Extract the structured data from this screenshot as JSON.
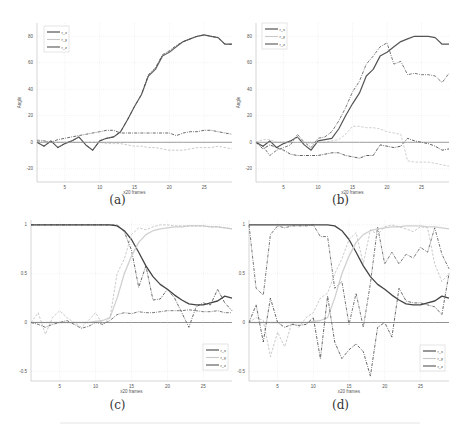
{
  "figure": {
    "captions": [
      "(a)",
      "(b)",
      "(c)",
      "(d)"
    ]
  },
  "chart_data": [
    {
      "id": "a",
      "type": "line",
      "caption": "(a)",
      "xlabel": "x20 frames",
      "ylabel": "Angle",
      "xlim": [
        1,
        29
      ],
      "ylim": [
        -30,
        90
      ],
      "xticks": [
        5,
        10,
        15,
        20,
        25
      ],
      "yticks": [
        -20,
        0,
        20,
        40,
        60,
        80
      ],
      "grid": true,
      "legend": {
        "position": "upper left",
        "entries": [
          "r_x",
          "r_y",
          "r_z"
        ]
      },
      "x": [
        1,
        2,
        3,
        4,
        5,
        6,
        7,
        8,
        9,
        10,
        11,
        12,
        13,
        14,
        15,
        16,
        17,
        18,
        19,
        20,
        21,
        22,
        23,
        24,
        25,
        26,
        27,
        28,
        29
      ],
      "series": [
        {
          "name": "ground truth",
          "style": "solid",
          "color": "#666666",
          "width": 1.2,
          "values": [
            0,
            -3,
            1,
            -4,
            -1,
            1,
            4,
            -2,
            -6,
            1,
            3,
            4,
            8,
            17,
            27,
            36,
            50,
            55,
            65,
            68,
            72,
            76,
            78,
            80,
            81,
            80,
            79,
            74,
            74
          ]
        },
        {
          "name": "r_x",
          "style": "dashdot",
          "color": "#444444",
          "width": 0.8,
          "values": [
            0,
            -3,
            1,
            -4,
            -1,
            1,
            4,
            -2,
            -6,
            1,
            3,
            4,
            8,
            17,
            27,
            36,
            51,
            56,
            66,
            69,
            73,
            76,
            78,
            80,
            81,
            80,
            79,
            74,
            74
          ]
        },
        {
          "name": "r_y",
          "style": "dashdot",
          "color": "#444444",
          "width": 0.8,
          "values": [
            1,
            1,
            0,
            2,
            3,
            4,
            5,
            6,
            7,
            8,
            9,
            9,
            7,
            7,
            7,
            7,
            7,
            7,
            7,
            7,
            5,
            7,
            8,
            8,
            9,
            9,
            8,
            7,
            6
          ]
        },
        {
          "name": "r_z",
          "style": "dashed",
          "color": "#bdbdbd",
          "width": 0.8,
          "values": [
            2,
            1,
            0,
            0,
            0,
            0,
            0,
            0,
            0,
            0,
            -1,
            -1,
            -1,
            -2,
            -3,
            -3,
            -4,
            -4,
            -5,
            -6,
            -6,
            -6,
            -5,
            -4,
            -4,
            -4,
            -3,
            -4,
            -5
          ]
        },
        {
          "name": "zero",
          "style": "solid",
          "color": "#888888",
          "width": 0.8,
          "values": [
            0,
            0,
            0,
            0,
            0,
            0,
            0,
            0,
            0,
            0,
            0,
            0,
            0,
            0,
            0,
            0,
            0,
            0,
            0,
            0,
            0,
            0,
            0,
            0,
            0,
            0,
            0,
            0,
            0
          ]
        }
      ]
    },
    {
      "id": "b",
      "type": "line",
      "caption": "(b)",
      "xlabel": "x20 frames",
      "ylabel": "Angle",
      "xlim": [
        1,
        29
      ],
      "ylim": [
        -30,
        90
      ],
      "xticks": [
        5,
        10,
        15,
        20,
        25
      ],
      "yticks": [
        -20,
        0,
        20,
        40,
        60,
        80
      ],
      "grid": true,
      "legend": {
        "position": "upper left",
        "entries": [
          "r_x",
          "r_y",
          "r_z"
        ]
      },
      "x": [
        1,
        2,
        3,
        4,
        5,
        6,
        7,
        8,
        9,
        10,
        11,
        12,
        13,
        14,
        15,
        16,
        17,
        18,
        19,
        20,
        21,
        22,
        23,
        24,
        25,
        26,
        27,
        28,
        29
      ],
      "series": [
        {
          "name": "ground truth",
          "style": "solid",
          "color": "#555555",
          "width": 1.2,
          "values": [
            0,
            -3,
            1,
            -4,
            -1,
            1,
            4,
            -2,
            -6,
            1,
            2,
            3,
            10,
            20,
            29,
            37,
            50,
            55,
            65,
            68,
            72,
            76,
            78,
            80,
            80,
            80,
            79,
            74,
            74
          ]
        },
        {
          "name": "r_x",
          "style": "dashdot",
          "color": "#555555",
          "width": 0.8,
          "values": [
            0,
            -3,
            -10,
            -6,
            -4,
            -2,
            6,
            0,
            -4,
            3,
            4,
            8,
            16,
            26,
            38,
            46,
            59,
            65,
            72,
            75,
            59,
            61,
            51,
            52,
            51,
            51,
            50,
            45,
            52
          ]
        },
        {
          "name": "r_y",
          "style": "dashdot",
          "color": "#333333",
          "width": 0.8,
          "values": [
            0,
            -5,
            -2,
            -4,
            -6,
            -9,
            -10,
            -10,
            -10,
            -10,
            -9,
            -8,
            -8,
            -10,
            -11,
            -12,
            -10,
            -10,
            -2,
            -3,
            -4,
            -3,
            3,
            1,
            0,
            -1,
            -3,
            -6,
            -5
          ]
        },
        {
          "name": "r_z",
          "style": "dashed",
          "color": "#c4c4c4",
          "width": 0.8,
          "values": [
            0,
            2,
            2,
            0,
            0,
            0,
            4,
            0,
            -1,
            0,
            0,
            1,
            2,
            6,
            12,
            12,
            11,
            11,
            10,
            8,
            7,
            6,
            -14,
            -15,
            -15,
            -15,
            -16,
            -17,
            -18
          ]
        },
        {
          "name": "zero",
          "style": "solid",
          "color": "#888888",
          "width": 0.8,
          "values": [
            0,
            0,
            0,
            0,
            0,
            0,
            0,
            0,
            0,
            0,
            0,
            0,
            0,
            0,
            0,
            0,
            0,
            0,
            0,
            0,
            0,
            0,
            0,
            0,
            0,
            0,
            0,
            0,
            0
          ]
        }
      ]
    },
    {
      "id": "c",
      "type": "line",
      "caption": "(c)",
      "xlabel": "x20 frames",
      "ylabel": "",
      "xlim": [
        1,
        29
      ],
      "ylim": [
        -0.6,
        1.05
      ],
      "xticks": [
        5,
        10,
        15,
        20,
        25
      ],
      "yticks": [
        -0.5,
        0,
        0.5,
        1
      ],
      "grid": true,
      "legend": {
        "position": "lower right",
        "entries": [
          "r_x",
          "r_y",
          "r_z"
        ]
      },
      "x": [
        1,
        2,
        3,
        4,
        5,
        6,
        7,
        8,
        9,
        10,
        11,
        12,
        13,
        14,
        15,
        16,
        17,
        18,
        19,
        20,
        21,
        22,
        23,
        24,
        25,
        26,
        27,
        28,
        29
      ],
      "series": [
        {
          "name": "q_w",
          "style": "solid",
          "color": "#444444",
          "width": 1.3,
          "values": [
            1,
            1,
            1,
            1,
            1,
            1,
            1,
            1,
            1,
            1,
            1,
            1,
            0.99,
            0.94,
            0.85,
            0.72,
            0.58,
            0.47,
            0.39,
            0.34,
            0.28,
            0.23,
            0.19,
            0.18,
            0.18,
            0.2,
            0.22,
            0.27,
            0.25
          ]
        },
        {
          "name": "r_x",
          "style": "dashdot",
          "color": "#444444",
          "width": 0.8,
          "values": [
            1,
            1,
            1,
            1,
            1,
            1,
            1,
            1,
            1,
            1,
            1,
            1,
            1,
            0.93,
            0.74,
            0.36,
            0.58,
            0.23,
            0.24,
            0.34,
            0.25,
            0.1,
            -0.05,
            0.16,
            0.2,
            0.18,
            0.34,
            0.2,
            0.12
          ]
        },
        {
          "name": "q_y",
          "style": "solid",
          "color": "#d0d0d0",
          "width": 1.3,
          "values": [
            0,
            0,
            0,
            0,
            0,
            0,
            0,
            0,
            0,
            0.01,
            0.02,
            0.05,
            0.25,
            0.5,
            0.68,
            0.82,
            0.9,
            0.94,
            0.96,
            0.97,
            0.98,
            0.98,
            0.99,
            0.99,
            0.99,
            0.98,
            0.98,
            0.97,
            0.96
          ]
        },
        {
          "name": "r_y",
          "style": "dashed",
          "color": "#bdbdbd",
          "width": 0.8,
          "values": [
            0,
            0.1,
            -0.12,
            0.05,
            0.12,
            0.05,
            0,
            -0.05,
            0.02,
            0.1,
            -0.02,
            0.05,
            0.5,
            0.65,
            0.9,
            0.97,
            0.95,
            0.98,
            1,
            1,
            0.99,
            0.99,
            0.99,
            0.99,
            0.99,
            0.98,
            0.98,
            0.97,
            0.96
          ]
        },
        {
          "name": "r_z",
          "style": "dashdot",
          "color": "#555555",
          "width": 0.8,
          "values": [
            0,
            -0.02,
            -0.05,
            -0.02,
            0,
            0.02,
            -0.02,
            -0.06,
            -0.04,
            0,
            -0.02,
            0.02,
            0.08,
            0.1,
            0.09,
            0.11,
            0.1,
            0.1,
            0.11,
            0.12,
            0.12,
            0.12,
            0.13,
            0.12,
            0.11,
            0.11,
            0.12,
            0.1,
            0.1
          ]
        },
        {
          "name": "zero",
          "style": "solid",
          "color": "#777777",
          "width": 0.8,
          "values": [
            0,
            0,
            0,
            0,
            0,
            0,
            0,
            0,
            0,
            0,
            0,
            0,
            0,
            0,
            0,
            0,
            0,
            0,
            0,
            0,
            0,
            0,
            0,
            0,
            0,
            0,
            0,
            0,
            0
          ]
        }
      ]
    },
    {
      "id": "d",
      "type": "line",
      "caption": "(d)",
      "xlabel": "x20 frames",
      "ylabel": "",
      "xlim": [
        1,
        29
      ],
      "ylim": [
        -0.6,
        1.05
      ],
      "xticks": [
        5,
        10,
        15,
        20,
        25
      ],
      "yticks": [
        -0.5,
        0,
        0.5,
        1
      ],
      "grid": true,
      "legend": {
        "position": "lower right",
        "entries": [
          "r_x",
          "r_y",
          "r_z"
        ]
      },
      "x": [
        1,
        2,
        3,
        4,
        5,
        6,
        7,
        8,
        9,
        10,
        11,
        12,
        13,
        14,
        15,
        16,
        17,
        18,
        19,
        20,
        21,
        22,
        23,
        24,
        25,
        26,
        27,
        28,
        29
      ],
      "series": [
        {
          "name": "q_w",
          "style": "solid",
          "color": "#444444",
          "width": 1.3,
          "values": [
            1,
            1,
            1,
            1,
            1,
            1,
            1,
            1,
            1,
            1,
            1,
            1,
            0.99,
            0.94,
            0.85,
            0.72,
            0.58,
            0.47,
            0.39,
            0.34,
            0.28,
            0.23,
            0.19,
            0.18,
            0.18,
            0.2,
            0.22,
            0.27,
            0.25
          ]
        },
        {
          "name": "r_x",
          "style": "dashdot",
          "color": "#555555",
          "width": 0.8,
          "values": [
            1,
            0.35,
            0.28,
            0.9,
            0.99,
            0.97,
            0.99,
            0.99,
            0.99,
            1,
            0.88,
            0.88,
            0.35,
            0.42,
            -0.02,
            0.3,
            -0.05,
            0.4,
            0.98,
            0.6,
            0.72,
            0.6,
            0.7,
            0.66,
            0.77,
            0.72,
            0.97,
            0.7,
            0.55
          ]
        },
        {
          "name": "q_y",
          "style": "solid",
          "color": "#d0d0d0",
          "width": 1.3,
          "values": [
            0,
            0,
            0,
            0,
            0,
            0,
            0,
            0,
            0,
            0.01,
            0.02,
            0.05,
            0.25,
            0.5,
            0.68,
            0.82,
            0.9,
            0.94,
            0.96,
            0.97,
            0.98,
            0.98,
            0.99,
            0.99,
            0.99,
            0.98,
            0.98,
            0.97,
            0.96
          ]
        },
        {
          "name": "r_y",
          "style": "dashed",
          "color": "#bdbdbd",
          "width": 0.8,
          "values": [
            0,
            0.05,
            0.02,
            -0.35,
            -0.1,
            -0.25,
            0,
            -0.05,
            0.05,
            0.1,
            0.25,
            0.3,
            0.5,
            0.65,
            0.85,
            0.92,
            0.6,
            0.95,
            0.9,
            0.98,
            1,
            0.98,
            0.96,
            0.93,
            0.98,
            0.97,
            0.6,
            0.42,
            0.5
          ]
        },
        {
          "name": "r_z",
          "style": "dashdot",
          "color": "#444444",
          "width": 0.8,
          "values": [
            0,
            0.18,
            -0.2,
            0.25,
            0,
            -0.05,
            -0.02,
            -0.03,
            -0.02,
            0.05,
            -0.37,
            0.27,
            -0.2,
            -0.37,
            -0.28,
            -0.22,
            -0.3,
            -0.55,
            -0.05,
            0,
            -0.15,
            0.35,
            0.22,
            0.2,
            0.2,
            0.18,
            0.16,
            0.08,
            0.5
          ]
        },
        {
          "name": "zero",
          "style": "solid",
          "color": "#777777",
          "width": 0.8,
          "values": [
            0,
            0,
            0,
            0,
            0,
            0,
            0,
            0,
            0,
            0,
            0,
            0,
            0,
            0,
            0,
            0,
            0,
            0,
            0,
            0,
            0,
            0,
            0,
            0,
            0,
            0,
            0,
            0,
            0
          ]
        }
      ]
    }
  ]
}
